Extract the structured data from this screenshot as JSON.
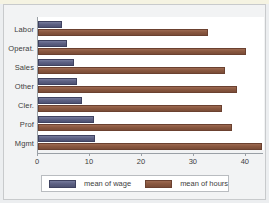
{
  "chart_data": {
    "type": "bar",
    "orientation": "horizontal",
    "title": "",
    "xlabel": "",
    "ylabel": "",
    "xlim": [
      0,
      43.5
    ],
    "xticks": [
      0,
      10,
      20,
      30,
      40
    ],
    "xticklabels": [
      "0",
      "10",
      "20",
      "30",
      "40"
    ],
    "grid": false,
    "categories": [
      "Labor",
      "Operat.",
      "Sales",
      "Other",
      "Cler.",
      "Prof",
      "Mgmt"
    ],
    "series": [
      {
        "name": "mean of wage",
        "color": "#5d6184",
        "values": [
          4.6,
          5.5,
          7.0,
          7.5,
          8.4,
          10.7,
          11.0
        ]
      },
      {
        "name": "mean of hours",
        "color": "#8a5840",
        "values": [
          32.7,
          40.0,
          36.0,
          38.3,
          35.4,
          37.4,
          43.2
        ]
      }
    ],
    "legend": {
      "position": "bottom",
      "entries": [
        "mean of wage",
        "mean of hours"
      ]
    }
  },
  "legend": {
    "entries": [
      {
        "label": "mean of wage",
        "swatch": "wage-swatch"
      },
      {
        "label": "mean of hours",
        "swatch": "hours-swatch"
      }
    ]
  }
}
